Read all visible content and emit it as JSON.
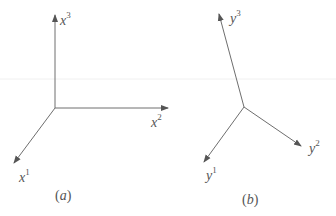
{
  "figure": {
    "panels": [
      {
        "id": "a",
        "caption_open": "(",
        "caption_letter": "a",
        "caption_close": ")",
        "origin": [
          55,
          108
        ],
        "axes": [
          {
            "name": "x1",
            "base": "x",
            "sup": "1",
            "tip": [
              14,
              163
            ]
          },
          {
            "name": "x2",
            "base": "x",
            "sup": "2",
            "tip": [
              168,
              108
            ]
          },
          {
            "name": "x3",
            "base": "x",
            "sup": "3",
            "tip": [
              55,
              15
            ]
          }
        ]
      },
      {
        "id": "b",
        "caption_open": "(",
        "caption_letter": "b",
        "caption_close": ")",
        "origin": [
          244,
          107
        ],
        "axes": [
          {
            "name": "y1",
            "base": "y",
            "sup": "1",
            "tip": [
              204,
              162
            ]
          },
          {
            "name": "y2",
            "base": "y",
            "sup": "2",
            "tip": [
              301,
              146
            ]
          },
          {
            "name": "y3",
            "base": "y",
            "sup": "3",
            "tip": [
              219,
              14
            ]
          }
        ]
      }
    ],
    "colors": {
      "axis": "#6e6e6e",
      "text": "#555555",
      "background": "#ffffff"
    }
  }
}
